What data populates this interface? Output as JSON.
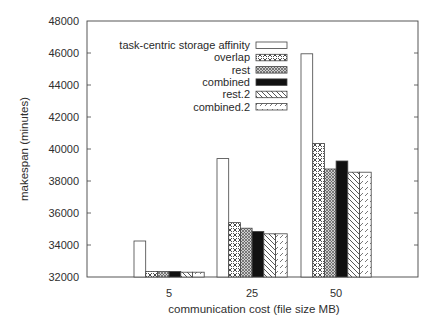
{
  "chart_data": {
    "type": "bar",
    "title": "",
    "xlabel": "communication cost (file size MB)",
    "ylabel": "makespan (minutes)",
    "categories": [
      "5",
      "25",
      "50"
    ],
    "ylim": [
      32000,
      48000
    ],
    "yticks": [
      32000,
      34000,
      36000,
      38000,
      40000,
      42000,
      44000,
      46000,
      48000
    ],
    "grid": false,
    "legend_position": "upper-left-inside",
    "series": [
      {
        "name": "task-centric storage affinity",
        "pattern": "empty",
        "values": [
          34250,
          39400,
          45950
        ]
      },
      {
        "name": "overlap",
        "pattern": "crosshatch-dense",
        "values": [
          32350,
          35400,
          40350
        ]
      },
      {
        "name": "rest",
        "pattern": "crosshatch-fine",
        "values": [
          32350,
          35050,
          38750
        ]
      },
      {
        "name": "combined",
        "pattern": "solid-black",
        "values": [
          32350,
          34850,
          39250
        ]
      },
      {
        "name": "rest.2",
        "pattern": "diagonal-back",
        "values": [
          32300,
          34700,
          38550
        ]
      },
      {
        "name": "combined.2",
        "pattern": "diagonal-dashed",
        "values": [
          32300,
          34700,
          38550
        ]
      }
    ]
  }
}
